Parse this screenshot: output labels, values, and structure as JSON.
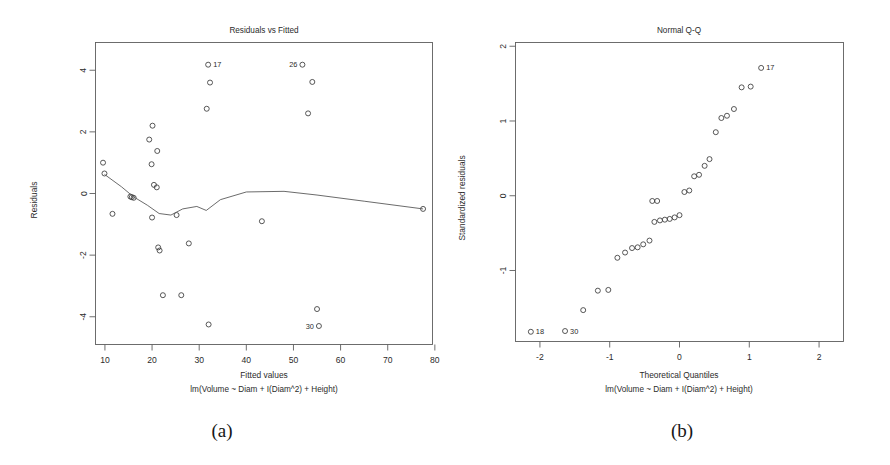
{
  "figure": {
    "captions": [
      {
        "id": "a",
        "label": "(a)"
      },
      {
        "id": "b",
        "label": "(b)"
      }
    ]
  },
  "chart_data": [
    {
      "type": "scatter",
      "panel": "a",
      "title": "Residuals vs Fitted",
      "xlabel": "Fitted values",
      "ylabel": "Residuals",
      "subtitle": "lm(Volume ~ Diam + I(Diam^2) + Height)",
      "xlim": [
        8.0,
        79.5
      ],
      "ylim": [
        -4.9,
        4.9
      ],
      "xticks": [
        10,
        20,
        30,
        40,
        50,
        60,
        70,
        80
      ],
      "yticks": [
        4,
        2,
        0,
        -2,
        -4
      ],
      "grid": false,
      "legend": "none",
      "marker": "open-circle",
      "points": [
        {
          "x": 9.6,
          "y": 1.0
        },
        {
          "x": 9.9,
          "y": 0.65
        },
        {
          "x": 11.6,
          "y": -0.66
        },
        {
          "x": 15.4,
          "y": -0.1
        },
        {
          "x": 15.7,
          "y": -0.12
        },
        {
          "x": 16.1,
          "y": -0.14
        },
        {
          "x": 19.4,
          "y": 1.75
        },
        {
          "x": 20.1,
          "y": 2.2
        },
        {
          "x": 19.9,
          "y": 0.95
        },
        {
          "x": 20.4,
          "y": 0.28
        },
        {
          "x": 21.0,
          "y": 0.2
        },
        {
          "x": 21.1,
          "y": 1.38
        },
        {
          "x": 20.0,
          "y": -0.78
        },
        {
          "x": 21.3,
          "y": -1.75
        },
        {
          "x": 21.6,
          "y": -1.85
        },
        {
          "x": 22.3,
          "y": -3.3
        },
        {
          "x": 25.2,
          "y": -0.7
        },
        {
          "x": 26.2,
          "y": -3.3
        },
        {
          "x": 27.8,
          "y": -1.62
        },
        {
          "x": 31.9,
          "y": 4.18
        },
        {
          "x": 32.3,
          "y": 3.6
        },
        {
          "x": 31.6,
          "y": 2.75
        },
        {
          "x": 32.0,
          "y": -4.25
        },
        {
          "x": 43.3,
          "y": -0.9
        },
        {
          "x": 51.9,
          "y": 4.18
        },
        {
          "x": 54.0,
          "y": 3.62
        },
        {
          "x": 53.1,
          "y": 2.6
        },
        {
          "x": 55.0,
          "y": -3.75
        },
        {
          "x": 55.4,
          "y": -4.3
        },
        {
          "x": 77.5,
          "y": -0.5
        }
      ],
      "labeled_points": [
        {
          "label": "17",
          "x": 31.9,
          "y": 4.18,
          "side": "right"
        },
        {
          "label": "26",
          "x": 51.9,
          "y": 4.18,
          "side": "left"
        },
        {
          "label": "30",
          "x": 55.4,
          "y": -4.3,
          "side": "left"
        }
      ],
      "smooth_line": [
        {
          "x": 9.9,
          "y": 0.62
        },
        {
          "x": 13.5,
          "y": 0.22
        },
        {
          "x": 16.0,
          "y": -0.1
        },
        {
          "x": 19.0,
          "y": -0.38
        },
        {
          "x": 21.5,
          "y": -0.65
        },
        {
          "x": 24.0,
          "y": -0.7
        },
        {
          "x": 26.5,
          "y": -0.5
        },
        {
          "x": 29.5,
          "y": -0.42
        },
        {
          "x": 31.5,
          "y": -0.55
        },
        {
          "x": 34.5,
          "y": -0.2
        },
        {
          "x": 40.0,
          "y": 0.05
        },
        {
          "x": 48.0,
          "y": 0.07
        },
        {
          "x": 55.0,
          "y": -0.05
        },
        {
          "x": 65.0,
          "y": -0.25
        },
        {
          "x": 77.5,
          "y": -0.5
        }
      ]
    },
    {
      "type": "scatter",
      "panel": "b",
      "title": "Normal Q-Q",
      "xlabel": "Theoretical Quantiles",
      "ylabel": "Standardized residuals",
      "subtitle": "lm(Volume ~ Diam + I(Diam^2) + Height)",
      "xlim": [
        -2.35,
        2.35
      ],
      "ylim": [
        -1.95,
        2.05
      ],
      "xticks": [
        -2,
        -1,
        0,
        1,
        2
      ],
      "yticks": [
        2,
        1,
        0,
        -1
      ],
      "grid": false,
      "legend": "none",
      "marker": "open-circle",
      "points": [
        {
          "x": -2.13,
          "y": -1.82
        },
        {
          "x": -1.64,
          "y": -1.81
        },
        {
          "x": -1.38,
          "y": -1.53
        },
        {
          "x": -1.17,
          "y": -1.27
        },
        {
          "x": -1.02,
          "y": -1.26
        },
        {
          "x": -0.89,
          "y": -0.83
        },
        {
          "x": -0.78,
          "y": -0.76
        },
        {
          "x": -0.68,
          "y": -0.7
        },
        {
          "x": -0.6,
          "y": -0.69
        },
        {
          "x": -0.52,
          "y": -0.65
        },
        {
          "x": -0.43,
          "y": -0.6
        },
        {
          "x": -0.36,
          "y": -0.35
        },
        {
          "x": -0.28,
          "y": -0.33
        },
        {
          "x": -0.21,
          "y": -0.32
        },
        {
          "x": -0.14,
          "y": -0.31
        },
        {
          "x": -0.07,
          "y": -0.29
        },
        {
          "x": 0.0,
          "y": -0.26
        },
        {
          "x": -0.39,
          "y": -0.07
        },
        {
          "x": -0.32,
          "y": -0.07
        },
        {
          "x": 0.07,
          "y": 0.05
        },
        {
          "x": 0.14,
          "y": 0.07
        },
        {
          "x": 0.21,
          "y": 0.26
        },
        {
          "x": 0.28,
          "y": 0.28
        },
        {
          "x": 0.36,
          "y": 0.4
        },
        {
          "x": 0.43,
          "y": 0.49
        },
        {
          "x": 0.52,
          "y": 0.85
        },
        {
          "x": 0.6,
          "y": 1.04
        },
        {
          "x": 0.68,
          "y": 1.07
        },
        {
          "x": 0.78,
          "y": 1.16
        },
        {
          "x": 0.89,
          "y": 1.45
        },
        {
          "x": 1.02,
          "y": 1.46
        },
        {
          "x": 1.17,
          "y": 1.71
        }
      ],
      "labeled_points": [
        {
          "label": "18",
          "x": -2.13,
          "y": -1.82,
          "side": "right"
        },
        {
          "label": "30",
          "x": -1.64,
          "y": -1.81,
          "side": "right"
        },
        {
          "label": "17",
          "x": 1.17,
          "y": 1.71,
          "side": "right"
        }
      ]
    }
  ]
}
